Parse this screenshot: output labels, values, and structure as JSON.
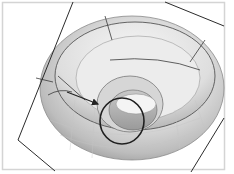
{
  "figure": {
    "colors": {
      "background": "#ffffff",
      "frame": "#d4d4d4",
      "surface_light": "#e9e9e9",
      "surface_mid": "#cfcfcf",
      "surface_dark": "#a9a9a9",
      "lines": "#2b2b2b",
      "highlight_curve": "#1f1f1f"
    },
    "annotations": {
      "arrow": "pointer-arrow"
    }
  }
}
